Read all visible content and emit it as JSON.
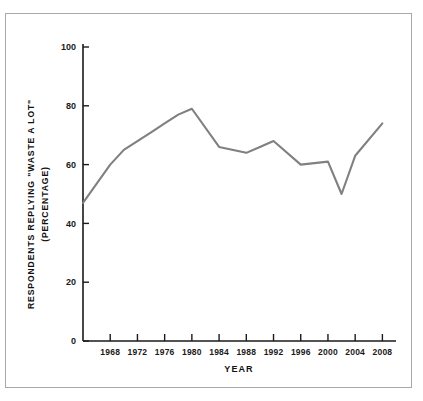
{
  "figure": {
    "background_color": "#ffffff",
    "frame_color": "#a8a8a8"
  },
  "chart_data": {
    "type": "line",
    "title": "",
    "xlabel": "YEAR",
    "ylabel_line1": "RESPONDENTS REPLYING \"WASTE A LOT\"",
    "ylabel_line2": "(PERCENTAGE)",
    "xlim": [
      1964,
      2010
    ],
    "ylim": [
      0,
      100
    ],
    "grid": false,
    "legend": "none",
    "line_color": "#808080",
    "line_width": 2.1,
    "x_tick_labels": [
      "1968",
      "1972",
      "1976",
      "1980",
      "1984",
      "1988",
      "1992",
      "1996",
      "2000",
      "2004",
      "2008"
    ],
    "x_ticks": [
      1968,
      1972,
      1976,
      1980,
      1984,
      1988,
      1992,
      1996,
      2000,
      2004,
      2008
    ],
    "y_tick_labels": [
      "0",
      "20",
      "40",
      "60",
      "80",
      "100"
    ],
    "y_ticks": [
      0,
      20,
      40,
      60,
      80,
      100
    ],
    "x": [
      1964,
      1968,
      1970,
      1972,
      1974,
      1976,
      1978,
      1980,
      1984,
      1988,
      1990,
      1992,
      1996,
      2000,
      2002,
      2004,
      2008
    ],
    "values": [
      47,
      60,
      65,
      68,
      71,
      74,
      77,
      79,
      66,
      64,
      66,
      68,
      60,
      61,
      50,
      63,
      74
    ],
    "series": [
      {
        "name": "Respondents replying \"waste a lot\"",
        "values": [
          47,
          60,
          65,
          68,
          71,
          74,
          77,
          79,
          66,
          64,
          66,
          68,
          60,
          61,
          50,
          63,
          74
        ]
      }
    ]
  }
}
